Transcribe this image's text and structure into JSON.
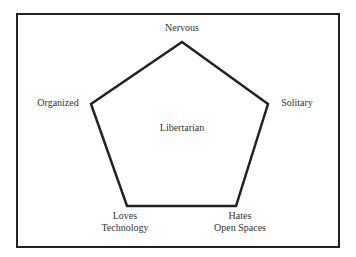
{
  "diagram": {
    "type": "pentagon",
    "center_label": "Libertarian",
    "vertices": [
      {
        "id": "top",
        "label": "Nervous"
      },
      {
        "id": "right",
        "label": "Solitary"
      },
      {
        "id": "bottom_right",
        "label_line1": "Hates",
        "label_line2": "Open Spaces"
      },
      {
        "id": "bottom_left",
        "label_line1": "Loves",
        "label_line2": "Technology"
      },
      {
        "id": "left",
        "label": "Organized"
      }
    ],
    "colors": {
      "stroke": "#222222",
      "text": "#333333",
      "background": "#ffffff"
    }
  }
}
